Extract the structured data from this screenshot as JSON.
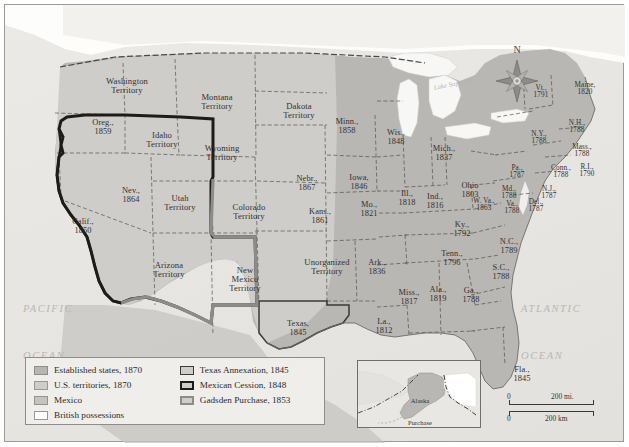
{
  "figure": {
    "compass": {
      "north_label": "N",
      "icon": "compass-rose-icon"
    },
    "ocean_labels": [
      {
        "name": "pacific-ocean-label",
        "line1": "PACIFIC",
        "line2": "OCEAN"
      },
      {
        "name": "atlantic-ocean-label",
        "line1": "ATLANTIC",
        "line2": "OCEAN"
      }
    ],
    "water_features": [
      {
        "name": "lake-superior-label",
        "text": "Lake Superior"
      }
    ]
  },
  "legend": {
    "items_left": [
      {
        "key": "established",
        "label": "Established states, 1870",
        "swatch": "sw-established",
        "color": "#b8b6b2"
      },
      {
        "key": "territories",
        "label": "U.S. territories, 1870",
        "swatch": "sw-territories",
        "color": "#cfcdc9"
      },
      {
        "key": "mexico",
        "label": "Mexico",
        "swatch": "sw-mexico",
        "color": "#c6c4c0"
      },
      {
        "key": "british",
        "label": "British possessions",
        "swatch": "sw-british",
        "color": "#ffffff"
      }
    ],
    "items_right": [
      {
        "key": "texas",
        "label": "Texas Annexation, 1845",
        "swatch": "sw-texas",
        "color": "#3a3a38"
      },
      {
        "key": "cession",
        "label": "Mexican Cession, 1848",
        "swatch": "sw-cession",
        "color": "#1c1c1a"
      },
      {
        "key": "gadsden",
        "label": "Gadsden Purchase, 1853",
        "swatch": "sw-gadsden",
        "color": "#8e8c88"
      }
    ]
  },
  "inset": {
    "name": "alaska-purchase-inset",
    "label_line1": "Alaska",
    "label_line2": "Purchase"
  },
  "scale": {
    "miles_zero": "0",
    "miles_value": "200 mi.",
    "km_zero": "0",
    "km_value": "200 km"
  },
  "places": [
    {
      "id": "washington-territory",
      "line1": "Washington",
      "line2": "Territory",
      "x": 86,
      "y": 72,
      "w": 72,
      "cls": "terr"
    },
    {
      "id": "oregon",
      "line1": "Oreg.,",
      "line2": "1859",
      "x": 75,
      "y": 114,
      "w": 46,
      "cls": "state"
    },
    {
      "id": "idaho-territory",
      "line1": "Idaho",
      "line2": "Territory",
      "x": 130,
      "y": 126,
      "w": 54,
      "cls": "terr"
    },
    {
      "id": "montana-territory",
      "line1": "Montana",
      "line2": "Territory",
      "x": 183,
      "y": 88,
      "w": 58,
      "cls": "terr"
    },
    {
      "id": "wyoming-territory",
      "line1": "Wyoming",
      "line2": "Territory",
      "x": 188,
      "y": 139,
      "w": 58,
      "cls": "terr"
    },
    {
      "id": "dakota-territory",
      "line1": "Dakota",
      "line2": "Territory",
      "x": 265,
      "y": 97,
      "w": 58,
      "cls": "terr"
    },
    {
      "id": "nevada",
      "line1": "Nev.,",
      "line2": "1864",
      "x": 106,
      "y": 182,
      "w": 40,
      "cls": "state"
    },
    {
      "id": "utah-territory",
      "line1": "Utah",
      "line2": "Territory",
      "x": 148,
      "y": 189,
      "w": 54,
      "cls": "terr"
    },
    {
      "id": "california",
      "line1": "Calif.,",
      "line2": "1850",
      "x": 56,
      "y": 213,
      "w": 44,
      "cls": "state"
    },
    {
      "id": "arizona-territory",
      "line1": "Arizona",
      "line2": "Territory",
      "x": 137,
      "y": 256,
      "w": 54,
      "cls": "terr"
    },
    {
      "id": "colorado-territory",
      "line1": "Colorado",
      "line2": "Territory",
      "x": 215,
      "y": 198,
      "w": 58,
      "cls": "terr"
    },
    {
      "id": "new-mexico-territory",
      "line1": "New",
      "line2": "Mexico",
      "line3": "Territory",
      "x": 213,
      "y": 261,
      "w": 54,
      "cls": "terr"
    },
    {
      "id": "nebraska",
      "line1": "Nebr.,",
      "line2": "1867",
      "x": 281,
      "y": 170,
      "w": 42,
      "cls": "state"
    },
    {
      "id": "kansas",
      "line1": "Kans.,",
      "line2": "1861",
      "x": 294,
      "y": 203,
      "w": 42,
      "cls": "state"
    },
    {
      "id": "unorganized-territory",
      "line1": "Unorganized",
      "line2": "Territory",
      "x": 287,
      "y": 253,
      "w": 70,
      "cls": "terr"
    },
    {
      "id": "texas",
      "line1": "Texas,",
      "line2": "1845",
      "x": 272,
      "y": 315,
      "w": 42,
      "cls": "state"
    },
    {
      "id": "minnesota",
      "line1": "Minn.,",
      "line2": "1858",
      "x": 322,
      "y": 113,
      "w": 40,
      "cls": "state"
    },
    {
      "id": "iowa",
      "line1": "Iowa,",
      "line2": "1846",
      "x": 334,
      "y": 169,
      "w": 40,
      "cls": "state"
    },
    {
      "id": "missouri",
      "line1": "Mo.,",
      "line2": "1821",
      "x": 345,
      "y": 196,
      "w": 38,
      "cls": "state"
    },
    {
      "id": "arkansas",
      "line1": "Ark.,",
      "line2": "1836",
      "x": 353,
      "y": 254,
      "w": 38,
      "cls": "state"
    },
    {
      "id": "louisiana",
      "line1": "La.,",
      "line2": "1812",
      "x": 362,
      "y": 313,
      "w": 34,
      "cls": "state"
    },
    {
      "id": "mississippi",
      "line1": "Miss.,",
      "line2": "1817",
      "x": 385,
      "y": 284,
      "w": 38,
      "cls": "state"
    },
    {
      "id": "alabama",
      "line1": "Ala.,",
      "line2": "1819",
      "x": 415,
      "y": 281,
      "w": 36,
      "cls": "state"
    },
    {
      "id": "wisconsin",
      "line1": "Wis.,",
      "line2": "1848",
      "x": 372,
      "y": 124,
      "w": 38,
      "cls": "state"
    },
    {
      "id": "illinois",
      "line1": "Ill.,",
      "line2": "1818",
      "x": 385,
      "y": 185,
      "w": 34,
      "cls": "state"
    },
    {
      "id": "indiana",
      "line1": "Ind.,",
      "line2": "1816",
      "x": 412,
      "y": 188,
      "w": 36,
      "cls": "state"
    },
    {
      "id": "michigan",
      "line1": "Mich.,",
      "line2": "1837",
      "x": 419,
      "y": 140,
      "w": 40,
      "cls": "state"
    },
    {
      "id": "ohio",
      "line1": "Ohio",
      "line2": "1803",
      "x": 447,
      "y": 177,
      "w": 36,
      "cls": "state"
    },
    {
      "id": "kentucky",
      "line1": "Ky.,",
      "line2": "1792",
      "x": 440,
      "y": 216,
      "w": 34,
      "cls": "state"
    },
    {
      "id": "tennessee",
      "line1": "Tenn.,",
      "line2": "1796",
      "x": 427,
      "y": 245,
      "w": 40,
      "cls": "state"
    },
    {
      "id": "georgia",
      "line1": "Ga.,",
      "line2": "1788",
      "x": 449,
      "y": 282,
      "w": 34,
      "cls": "state"
    },
    {
      "id": "florida",
      "line1": "Fla.,",
      "line2": "1845",
      "x": 500,
      "y": 361,
      "w": 34,
      "cls": "state"
    },
    {
      "id": "south-carolina",
      "line1": "S.C.,",
      "line2": "1788",
      "x": 479,
      "y": 259,
      "w": 34,
      "cls": "state"
    },
    {
      "id": "north-carolina",
      "line1": "N.C.,",
      "line2": "1789",
      "x": 487,
      "y": 233,
      "w": 34,
      "cls": "state"
    },
    {
      "id": "virginia",
      "line1": "Va.,",
      "line2": "1788",
      "x": 492,
      "y": 196,
      "w": 30,
      "cls": "small"
    },
    {
      "id": "west-virginia",
      "line1": "W. Va.,",
      "line2": "1863",
      "x": 462,
      "y": 193,
      "w": 34,
      "cls": "small"
    },
    {
      "id": "maryland",
      "line1": "Md.,",
      "line2": "1788",
      "x": 489,
      "y": 181,
      "w": 30,
      "cls": "small"
    },
    {
      "id": "delaware",
      "line1": "Del.,",
      "line2": "1787",
      "x": 517,
      "y": 194,
      "w": 28,
      "cls": "small"
    },
    {
      "id": "pennsylvania",
      "line1": "Pa.,",
      "line2": "1787",
      "x": 497,
      "y": 160,
      "w": 30,
      "cls": "small"
    },
    {
      "id": "new-jersey",
      "line1": "N.J.,",
      "line2": "1787",
      "x": 530,
      "y": 181,
      "w": 28,
      "cls": "small"
    },
    {
      "id": "new-york",
      "line1": "N.Y.,",
      "line2": "1788",
      "x": 518,
      "y": 126,
      "w": 32,
      "cls": "small"
    },
    {
      "id": "connecticut",
      "line1": "Conn.,",
      "line2": "1788",
      "x": 540,
      "y": 160,
      "w": 32,
      "cls": "small"
    },
    {
      "id": "rhode-island",
      "line1": "R.I.,",
      "line2": "1790",
      "x": 568,
      "y": 159,
      "w": 28,
      "cls": "small"
    },
    {
      "id": "massachusetts",
      "line1": "Mass.,",
      "line2": "1788",
      "x": 561,
      "y": 139,
      "w": 32,
      "cls": "small"
    },
    {
      "id": "new-hampshire",
      "line1": "N.H.,",
      "line2": "1788",
      "x": 557,
      "y": 115,
      "w": 30,
      "cls": "small"
    },
    {
      "id": "vermont",
      "line1": "Vt.,",
      "line2": "1791",
      "x": 522,
      "y": 80,
      "w": 28,
      "cls": "small"
    },
    {
      "id": "maine",
      "line1": "Maine,",
      "line2": "1820",
      "x": 562,
      "y": 77,
      "w": 36,
      "cls": "small"
    }
  ]
}
